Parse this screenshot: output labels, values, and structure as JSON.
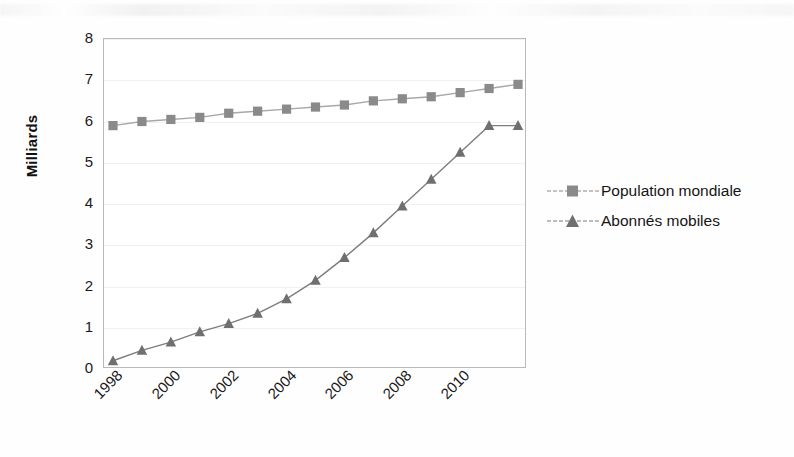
{
  "chart_data": {
    "type": "line",
    "title": "",
    "subtitle": "",
    "xlabel": "",
    "ylabel": "Milliards",
    "x": [
      1998,
      1999,
      2000,
      2001,
      2002,
      2003,
      2004,
      2005,
      2006,
      2007,
      2008,
      2009,
      2010,
      2011,
      2012
    ],
    "xlim": [
      1998,
      2012
    ],
    "ylim": [
      0,
      8
    ],
    "yticks": [
      0,
      1,
      2,
      3,
      4,
      5,
      6,
      7,
      8
    ],
    "ytick_labels": [
      "0",
      "1",
      "2",
      "3",
      "4",
      "5",
      "6",
      "7",
      "8"
    ],
    "xticks": [
      1998,
      2000,
      2002,
      2004,
      2006,
      2008,
      2010
    ],
    "xtick_labels": [
      "1998",
      "2000",
      "2002",
      "2004",
      "2006",
      "2008",
      "2010"
    ],
    "xtick_rotation": -45,
    "grid": true,
    "grid_axis": "y",
    "legend_position": "right",
    "series": [
      {
        "name": "Population mondiale",
        "marker": "square",
        "color": "#8a8a8a",
        "line_color": "#a8a8a8",
        "values": [
          5.9,
          6.0,
          6.05,
          6.1,
          6.2,
          6.25,
          6.3,
          6.35,
          6.4,
          6.5,
          6.55,
          6.6,
          6.7,
          6.8,
          6.9
        ]
      },
      {
        "name": "Abonnés mobiles",
        "marker": "triangle",
        "color": "#6f6f6f",
        "line_color": "#7d7d7d",
        "values": [
          0.2,
          0.45,
          0.65,
          0.9,
          1.1,
          1.35,
          1.7,
          2.15,
          2.7,
          3.3,
          3.95,
          4.6,
          5.25,
          5.9,
          5.9
        ]
      }
    ]
  },
  "axes": {
    "y_title": "Milliards",
    "y_ticks": [
      "8",
      "7",
      "6",
      "5",
      "4",
      "3",
      "2",
      "1",
      "0"
    ],
    "x_ticks": [
      "1998",
      "2000",
      "2002",
      "2004",
      "2006",
      "2008",
      "2010"
    ]
  },
  "legend": {
    "items": [
      {
        "label": "Population mondiale",
        "marker": "square-marker-icon"
      },
      {
        "label": "Abonnés mobiles",
        "marker": "triangle-marker-icon"
      }
    ]
  }
}
